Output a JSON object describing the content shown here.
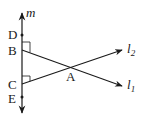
{
  "diagram": {
    "type": "geometry",
    "lines": [
      {
        "name": "m",
        "label": "m",
        "orientation": "vertical",
        "bidirectional": true
      },
      {
        "name": "l1",
        "label": "l",
        "subscript": "1",
        "from": "B",
        "through": "A"
      },
      {
        "name": "l2",
        "label": "l",
        "subscript": "2",
        "from": "C",
        "through": "A"
      }
    ],
    "points": [
      {
        "name": "D",
        "label": "D",
        "on": "m"
      },
      {
        "name": "B",
        "label": "B",
        "on": "m",
        "right_angle": true
      },
      {
        "name": "C",
        "label": "C",
        "on": "m",
        "right_angle": true
      },
      {
        "name": "E",
        "label": "E",
        "on": "m"
      },
      {
        "name": "A",
        "label": "A",
        "intersection_of": [
          "l1",
          "l2"
        ]
      }
    ],
    "colors": {
      "stroke": "#1a1a1a",
      "background": "#ffffff"
    }
  }
}
